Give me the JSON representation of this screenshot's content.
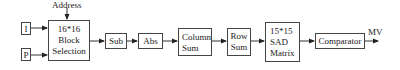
{
  "diagram": {
    "inputs": {
      "i": "I",
      "p": "P",
      "address": "Address"
    },
    "blocks": {
      "block_selection": [
        "16*16",
        "Block",
        "Selection"
      ],
      "sub": "Sub",
      "abs": "Abs",
      "column_sum": [
        "Column",
        "Sum"
      ],
      "row_sum": [
        "Row",
        "Sum"
      ],
      "sad_matrix": [
        "15*15",
        "SAD",
        "Matrix"
      ],
      "comparator": "Comparator"
    },
    "output": {
      "mv": "MV"
    },
    "colors": {
      "line": "#333333",
      "box_border": "#444444",
      "background": "#ffffff"
    }
  }
}
